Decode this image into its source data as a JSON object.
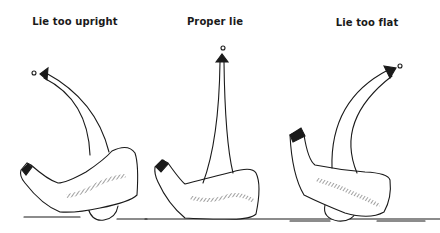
{
  "panels": [
    {
      "id": "upright",
      "title": "Lie too upright",
      "ball_flight": "left"
    },
    {
      "id": "proper",
      "title": "Proper lie",
      "ball_flight": "straight"
    },
    {
      "id": "flat",
      "title": "Lie too flat",
      "ball_flight": "right"
    }
  ],
  "colors": {
    "ink": "#1a1a1a",
    "background": "#ffffff",
    "shade": "#555555"
  }
}
